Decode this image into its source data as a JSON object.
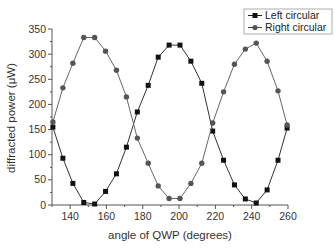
{
  "chart_data": {
    "type": "line",
    "title": "",
    "xlabel": "angle of QWP (degrees)",
    "ylabel": "diffracted power (μW)",
    "xlim": [
      130,
      260
    ],
    "ylim": [
      0,
      350
    ],
    "xticks": [
      140,
      160,
      180,
      200,
      220,
      240,
      260
    ],
    "yticks": [
      0,
      50,
      100,
      150,
      200,
      250,
      300,
      350
    ],
    "grid": false,
    "legend_position": "top-right",
    "series": [
      {
        "name": "Left circular",
        "marker": "square",
        "color": "#111111",
        "x": [
          130.5,
          136,
          141.5,
          147.5,
          153.5,
          159.5,
          165.5,
          171,
          177,
          183,
          188.5,
          194.5,
          200.5,
          206.5,
          212.5,
          218.5,
          224.5,
          230.5,
          236.5,
          242.5,
          248.5,
          254.5,
          259.5
        ],
        "values": [
          155,
          93,
          43,
          5,
          2,
          27,
          62,
          115,
          185,
          238,
          294,
          318,
          318,
          286,
          242,
          147,
          89,
          40,
          12,
          4,
          30,
          89,
          153
        ]
      },
      {
        "name": "Right circular",
        "marker": "circle",
        "color": "#555555",
        "x": [
          130.5,
          136,
          141.5,
          147.5,
          153.5,
          159.5,
          165.5,
          171,
          177,
          183,
          188.5,
          194.5,
          200.5,
          206.5,
          212.5,
          218.5,
          224.5,
          230.5,
          236.5,
          242.5,
          248.5,
          254.5,
          259.5
        ],
        "values": [
          165,
          233,
          282,
          333,
          333,
          306,
          268,
          215,
          133,
          83,
          38,
          13,
          13,
          43,
          83,
          163,
          225,
          280,
          310,
          322,
          286,
          227,
          159
        ]
      }
    ]
  },
  "legend": {
    "items": [
      {
        "label": "Left circular"
      },
      {
        "label": "Right circular"
      }
    ]
  },
  "axes": {
    "x_title": "angle of QWP (degrees)",
    "y_title": "diffracted power (μW)",
    "x_tick_labels": [
      "140",
      "160",
      "180",
      "200",
      "220",
      "240",
      "260"
    ],
    "y_tick_labels": [
      "0",
      "50",
      "100",
      "150",
      "200",
      "250",
      "300",
      "350"
    ]
  }
}
